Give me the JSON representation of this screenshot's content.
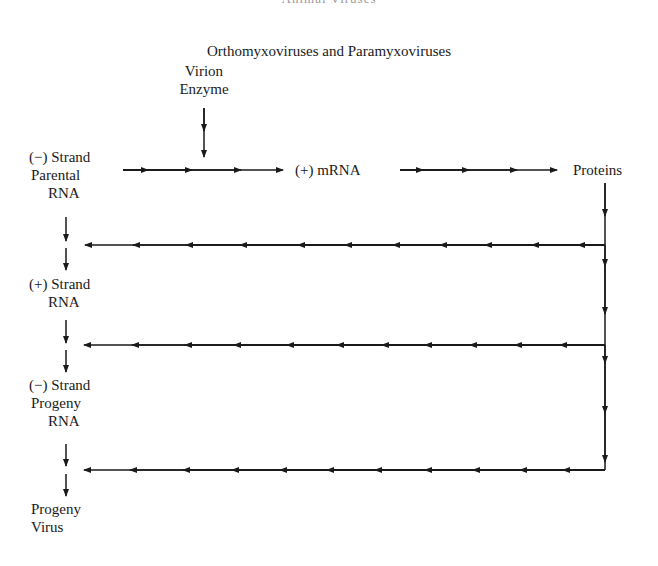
{
  "running_head": "Animal Viruses",
  "title": "Orthomyxoviruses and Paramyxoviruses",
  "nodes": {
    "virion_enzyme": {
      "line1": "Virion",
      "line2": "Enzyme"
    },
    "parental_rna": {
      "line1": "(−) Strand",
      "line2": "Parental",
      "line3": "RNA"
    },
    "mrna": {
      "label": "(+) mRNA"
    },
    "proteins": {
      "label": "Proteins"
    },
    "plus_strand_rna": {
      "line1": "(+) Strand",
      "line2": "RNA"
    },
    "progeny_rna": {
      "line1": "(−) Strand",
      "line2": "Progeny",
      "line3": "RNA"
    },
    "progeny_virus": {
      "line1": "Progeny",
      "line2": "Virus"
    }
  },
  "edges": [
    {
      "from": "virion_enzyme",
      "to": "parental_rna->mrna",
      "direction": "down"
    },
    {
      "from": "parental_rna",
      "to": "mrna",
      "direction": "right"
    },
    {
      "from": "mrna",
      "to": "proteins",
      "direction": "right"
    },
    {
      "from": "proteins",
      "to": "parental_rna->plus_strand_rna",
      "direction": "left"
    },
    {
      "from": "proteins",
      "to": "plus_strand_rna->progeny_rna",
      "direction": "left"
    },
    {
      "from": "proteins",
      "to": "progeny_rna->progeny_virus",
      "direction": "left"
    },
    {
      "from": "parental_rna",
      "to": "plus_strand_rna",
      "direction": "down"
    },
    {
      "from": "plus_strand_rna",
      "to": "progeny_rna",
      "direction": "down"
    },
    {
      "from": "progeny_rna",
      "to": "progeny_virus",
      "direction": "down"
    }
  ],
  "colors": {
    "ink": "#1a1a1a",
    "background": "#ffffff"
  }
}
